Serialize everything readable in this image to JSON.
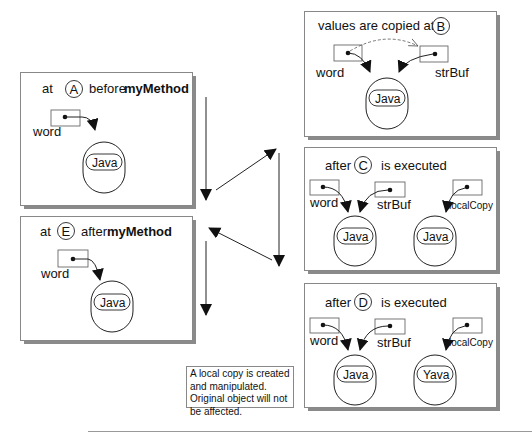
{
  "diagram": {
    "type": "object-reference state diagram",
    "method_name": "myMethod",
    "panels": {
      "A": {
        "prefix": "at",
        "marker": "A",
        "suffix": "before",
        "bold": "myMethod",
        "refs": [
          "word"
        ],
        "objects": [
          "Java"
        ]
      },
      "B": {
        "prefix": "values are copied at",
        "marker": "B",
        "refs": [
          "word",
          "strBuf"
        ],
        "objects": [
          "Java"
        ]
      },
      "C": {
        "prefix": "after",
        "marker": "C",
        "suffix": "is executed",
        "refs": [
          "word",
          "strBuf",
          "localCopy"
        ],
        "objects": [
          "Java",
          "Java"
        ]
      },
      "D": {
        "prefix": "after",
        "marker": "D",
        "suffix": "is executed",
        "refs": [
          "word",
          "strBuf",
          "localCopy"
        ],
        "objects": [
          "Java",
          "Yava"
        ]
      },
      "E": {
        "prefix": "at",
        "marker": "E",
        "suffix": "after",
        "bold": "myMethod",
        "refs": [
          "word"
        ],
        "objects": [
          "Java"
        ]
      }
    },
    "note": "A local copy is created and manipulated. Original object will not be affected.",
    "flow": [
      "A",
      "B",
      "C",
      "D",
      "E"
    ]
  }
}
